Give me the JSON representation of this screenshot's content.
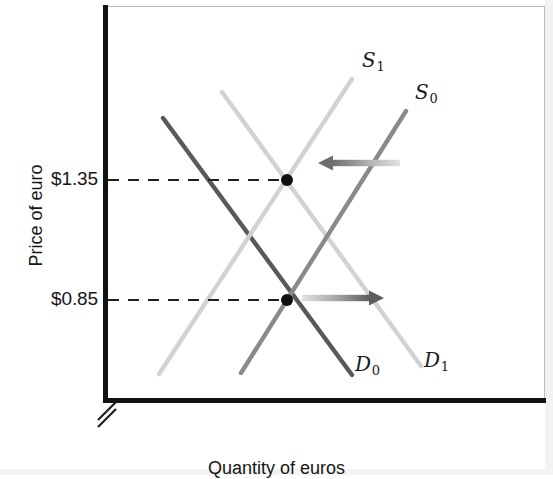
{
  "figure": {
    "type": "supply-demand-diagram",
    "background": "#ffffff"
  },
  "axes": {
    "y_title": "Price of euro",
    "x_title": "Quantity of euros",
    "y_ticks": [
      {
        "label": "$1.35",
        "value": 1.35,
        "y_px": 180
      },
      {
        "label": "$0.85",
        "value": 0.85,
        "y_px": 300
      }
    ],
    "has_axis_break": true,
    "axis_color": "#121212",
    "frame_color": "#bdbdbd"
  },
  "chart_data": {
    "type": "line",
    "title": "",
    "xlabel": "Quantity of euros",
    "ylabel": "Price of euro",
    "grid": false,
    "legend": "inline-curve-labels",
    "axis_note": "y-axis has a break symbol near the origin; x-axis is unscaled quantity",
    "series": [
      {
        "name": "D0",
        "label": "D",
        "subscript": "0",
        "role": "demand-initial",
        "color": "#595959",
        "width": 4.4,
        "x1": 163,
        "y1": 118,
        "x2": 352,
        "y2": 375,
        "slope": "downward",
        "label_x": 355,
        "label_y": 352
      },
      {
        "name": "D1",
        "label": "D",
        "subscript": "1",
        "role": "demand-new",
        "color": "#d2d2d2",
        "width": 4.4,
        "x1": 222,
        "y1": 92,
        "x2": 421,
        "y2": 366,
        "slope": "downward",
        "label_x": 424,
        "label_y": 348
      },
      {
        "name": "S1",
        "label": "S",
        "subscript": "1",
        "role": "supply-new",
        "color": "#d2d2d2",
        "width": 4.4,
        "x1": 159,
        "y1": 374,
        "x2": 352,
        "y2": 79,
        "slope": "upward",
        "label_x": 362,
        "label_y": 48
      },
      {
        "name": "S0",
        "label": "S",
        "subscript": "0",
        "role": "supply-initial",
        "color": "#8a8a8a",
        "width": 4.4,
        "x1": 241,
        "y1": 373,
        "x2": 406,
        "y2": 111,
        "slope": "upward",
        "label_x": 415,
        "label_y": 80
      }
    ],
    "equilibria": [
      {
        "name": "equilibrium-high",
        "price_label": "$1.35",
        "price": 1.35,
        "x_px": 287,
        "y_px": 180,
        "intersection_of": [
          "S1",
          "D1"
        ],
        "dot_color": "#101010",
        "dot_radius": 6
      },
      {
        "name": "equilibrium-low",
        "price_label": "$0.85",
        "price": 0.85,
        "x_px": 287,
        "y_px": 300,
        "intersection_of": [
          "S0",
          "D0"
        ],
        "dot_color": "#101010",
        "dot_radius": 6
      }
    ],
    "leader_lines": [
      {
        "name": "dashed-leader-135",
        "x1": 108,
        "x2": 282,
        "y": 180,
        "style": "dashed",
        "color": "#1f1f1f"
      },
      {
        "name": "dashed-leader-085",
        "x1": 108,
        "x2": 282,
        "y": 300,
        "style": "dashed",
        "color": "#1f1f1f"
      }
    ],
    "annotations": [
      {
        "name": "supply-shift-arrow-left",
        "direction": "left",
        "meaning": "supply curve shifts left from S0 to S1",
        "x_start": 400,
        "x_end": 318,
        "y": 163,
        "color_head": "#6e6e6e",
        "color_tail": "#dcdcdc"
      },
      {
        "name": "demand-shift-arrow-right",
        "direction": "right",
        "meaning": "demand curve shifts right from D0 to D1",
        "x_start": 302,
        "x_end": 384,
        "y": 298,
        "color_head": "#5e5e5e",
        "color_tail": "#dcdcdc"
      }
    ]
  }
}
